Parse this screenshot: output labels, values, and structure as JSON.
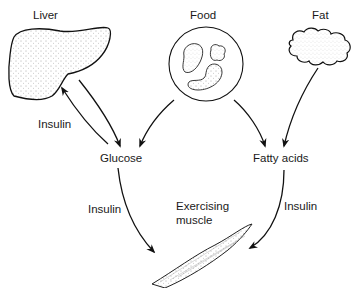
{
  "diagram": {
    "nodes": {
      "liver": "Liver",
      "food": "Food",
      "fat": "Fat",
      "glucose": "Glucose",
      "fatty_acids": "Fatty acids",
      "muscle_line1": "Exercising",
      "muscle_line2": "muscle"
    },
    "edge_labels": {
      "liver_glucose": "Insulin",
      "glucose_muscle": "Insulin",
      "fatty_acids_muscle": "Insulin"
    },
    "edges": [
      {
        "from": "Liver",
        "to": "Glucose"
      },
      {
        "from": "Glucose",
        "to": "Liver",
        "label": "Insulin"
      },
      {
        "from": "Food",
        "to": "Glucose"
      },
      {
        "from": "Food",
        "to": "Fatty acids"
      },
      {
        "from": "Fat",
        "to": "Fatty acids"
      },
      {
        "from": "Glucose",
        "to": "Exercising muscle",
        "label": "Insulin"
      },
      {
        "from": "Fatty acids",
        "to": "Exercising muscle",
        "label": "Insulin"
      }
    ]
  }
}
